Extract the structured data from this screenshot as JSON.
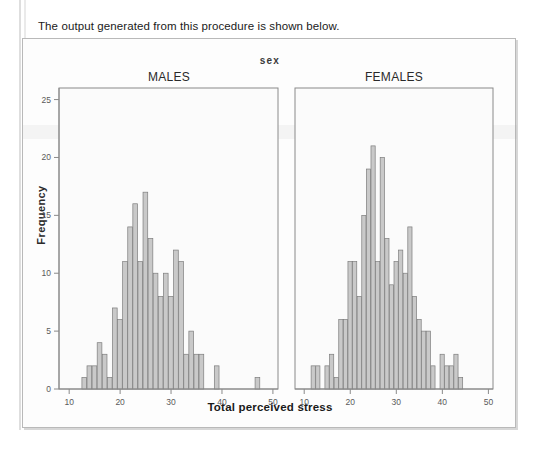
{
  "page": {
    "intro_text": "The output generated from this procedure is shown below."
  },
  "chart_data": {
    "type": "bar",
    "title": "sex",
    "xlabel": "Total perceived stress",
    "ylabel": "Frequency",
    "ylim": [
      0,
      26
    ],
    "xlim": [
      8,
      51
    ],
    "yticks": [
      0,
      5,
      10,
      15,
      20,
      25
    ],
    "ytick_labels": [
      "0",
      "5",
      "10",
      "15",
      "20",
      "25"
    ],
    "xticks": [
      10,
      20,
      30,
      40,
      50
    ],
    "xtick_labels": [
      "10",
      "20",
      "30",
      "40",
      "50"
    ],
    "grid": false,
    "legend": "none",
    "bin_width": 1,
    "panels": [
      {
        "name": "males",
        "label": "MALES",
        "x": [
          13,
          14,
          15,
          16,
          17,
          18,
          19,
          20,
          21,
          22,
          23,
          24,
          25,
          26,
          27,
          28,
          29,
          30,
          31,
          32,
          33,
          34,
          35,
          36,
          39,
          47
        ],
        "values": [
          1,
          2,
          2,
          4,
          3,
          1,
          7,
          6,
          11,
          14,
          16,
          11,
          17,
          13,
          10,
          8,
          10,
          8,
          12,
          11,
          3,
          5,
          3,
          3,
          2,
          1
        ]
      },
      {
        "name": "females",
        "label": "FEMALES",
        "x": [
          12,
          13,
          15,
          16,
          17,
          18,
          19,
          20,
          21,
          22,
          23,
          24,
          25,
          26,
          27,
          28,
          29,
          30,
          31,
          32,
          33,
          34,
          35,
          36,
          37,
          38,
          40,
          41,
          42,
          43,
          44
        ],
        "values": [
          2,
          2,
          2,
          3,
          1,
          6,
          6,
          11,
          11,
          8,
          15,
          19,
          21,
          11,
          20,
          13,
          9,
          11,
          12,
          10,
          14,
          8,
          6,
          5,
          5,
          2,
          3,
          2,
          2,
          3,
          1
        ]
      }
    ]
  }
}
